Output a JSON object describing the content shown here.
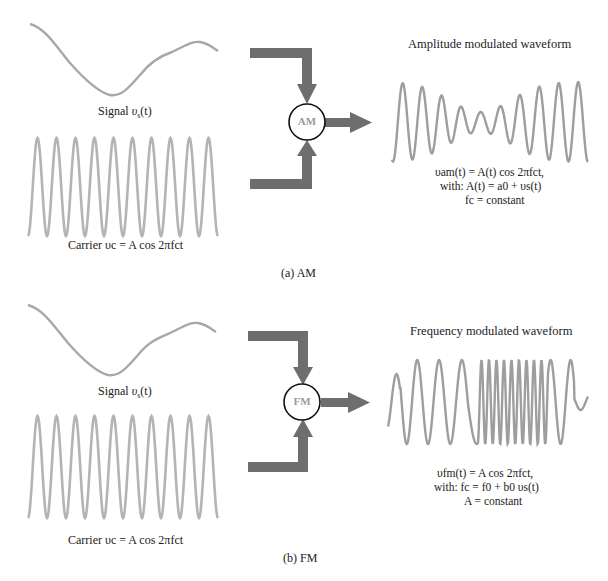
{
  "colors": {
    "waveform": "#a8a8a8",
    "arrow": "#6e6e6e",
    "circle_stroke": "#111111",
    "block_label": "#9a9a9a",
    "text": "#222222"
  },
  "panel_a": {
    "caption": "(a) AM",
    "signal_label_prefix": "Signal ",
    "signal_label_var": "υ",
    "signal_label_sub": "s",
    "signal_label_suffix": "(t)",
    "carrier_label": "Carrier υc = A cos 2πfct",
    "block_label": "AM",
    "output_title": "Amplitude modulated waveform",
    "equation_lines": [
      "υam(t) = A(t) cos 2πfct,",
      "with:  A(t) = a0 + υs(t)",
      "fc = constant"
    ]
  },
  "panel_b": {
    "caption": "(b) FM",
    "signal_label_prefix": "Signal ",
    "signal_label_var": "υ",
    "signal_label_sub": "s",
    "signal_label_suffix": "(t)",
    "carrier_label": "Carrier υc = A cos 2πfct",
    "block_label": "FM",
    "output_title": "Frequency modulated waveform",
    "equation_lines": [
      "υfm(t) = A cos 2πfct,",
      "with:  fc = f0 + b0 υs(t)",
      "A = constant"
    ]
  }
}
